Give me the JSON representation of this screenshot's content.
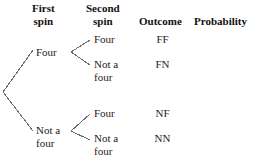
{
  "diagram": {
    "type": "probability-tree",
    "headers": [
      {
        "id": "first-spin",
        "line1": "First",
        "line2": "spin"
      },
      {
        "id": "second-spin",
        "line1": "Second",
        "line2": "spin"
      },
      {
        "id": "outcome",
        "line1": "Outcome",
        "line2": ""
      },
      {
        "id": "probability",
        "line1": "Probability",
        "line2": ""
      }
    ],
    "level1": [
      {
        "id": "four",
        "line1": "Four",
        "line2": ""
      },
      {
        "id": "not-a-four",
        "line1": "Not a",
        "line2": "four"
      }
    ],
    "level2": [
      {
        "id": "four-four",
        "line1": "Four",
        "line2": ""
      },
      {
        "id": "four-not-a-four",
        "line1": "Not a",
        "line2": "four"
      },
      {
        "id": "notfour-four",
        "line1": "Four",
        "line2": ""
      },
      {
        "id": "notfour-not-a-four",
        "line1": "Not a",
        "line2": "four"
      }
    ],
    "outcomes": [
      {
        "id": "ff",
        "label": "FF"
      },
      {
        "id": "fn",
        "label": "FN"
      },
      {
        "id": "nf",
        "label": "NF"
      },
      {
        "id": "nn",
        "label": "NN"
      }
    ],
    "probabilities": [
      {
        "id": "prob-ff",
        "label": ""
      },
      {
        "id": "prob-fn",
        "label": ""
      },
      {
        "id": "prob-nf",
        "label": ""
      },
      {
        "id": "prob-nn",
        "label": ""
      }
    ],
    "colors": {
      "background": "#ffffff",
      "text": "#1c1c1c",
      "header_text": "#101010",
      "branch_stroke": "#6b6b6b"
    }
  }
}
